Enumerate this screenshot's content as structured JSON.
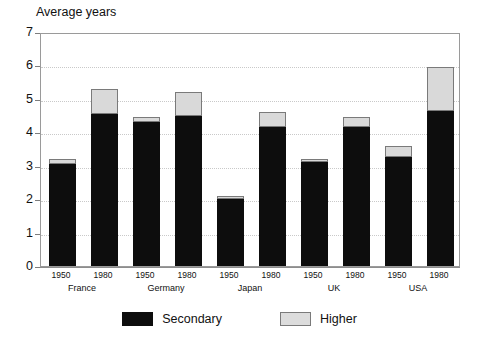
{
  "chart_data": {
    "type": "bar",
    "title": "Average years",
    "subtitle": "",
    "xlabel": "",
    "ylabel": "Average years",
    "ylim": [
      0,
      7
    ],
    "yticks": [
      0,
      1,
      2,
      3,
      4,
      5,
      6,
      7
    ],
    "grid": true,
    "grid_axis": "y",
    "stacked": true,
    "legend_position": "bottom",
    "categories": [
      "1950",
      "1980",
      "1950",
      "1980",
      "1950",
      "1980",
      "1950",
      "1980",
      "1950",
      "1980"
    ],
    "groups": [
      "France",
      "Germany",
      "Japan",
      "UK",
      "USA"
    ],
    "series": [
      {
        "name": "Secondary",
        "color": "#0d0d0d",
        "values": [
          3.05,
          4.55,
          4.3,
          4.5,
          2.0,
          4.15,
          3.1,
          4.15,
          3.25,
          4.65
        ]
      },
      {
        "name": "Higher",
        "color": "#d9d9d9",
        "values": [
          0.15,
          0.75,
          0.15,
          0.7,
          0.1,
          0.45,
          0.1,
          0.3,
          0.35,
          1.3
        ]
      }
    ],
    "totals": [
      3.2,
      5.3,
      4.45,
      5.2,
      2.1,
      4.6,
      3.2,
      4.45,
      3.6,
      5.95
    ]
  },
  "legend": {
    "items": [
      {
        "label": "Secondary",
        "swatch": "secondary"
      },
      {
        "label": "Higher",
        "swatch": "higher"
      }
    ]
  }
}
